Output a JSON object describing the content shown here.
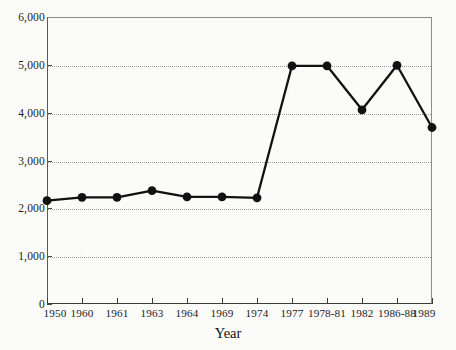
{
  "chart_data": {
    "type": "line",
    "title": "",
    "xlabel": "Year",
    "ylabel": "",
    "categories": [
      "1950",
      "1960",
      "1961",
      "1963",
      "1964",
      "1969",
      "1974",
      "1977",
      "1978-81",
      "1982",
      "1986-88",
      "1989"
    ],
    "values": [
      2160,
      2230,
      2230,
      2370,
      2240,
      2240,
      2220,
      4980,
      4980,
      4060,
      4990,
      3690
    ],
    "series": [
      {
        "name": "value",
        "values": [
          2160,
          2230,
          2230,
          2370,
          2240,
          2240,
          2220,
          4980,
          4980,
          4060,
          4990,
          3690
        ]
      }
    ],
    "ylim": [
      0,
      6000
    ],
    "ytick_values": [
      0,
      1000,
      2000,
      3000,
      4000,
      5000,
      6000
    ],
    "ytick_labels": [
      "0",
      "1,000",
      "2,000",
      "3,000",
      "4,000",
      "5,000",
      "6,000"
    ],
    "grid": true,
    "grid_axis": "y",
    "legend": "none",
    "marker": "filled-circle",
    "line_color": "#111111",
    "marker_color": "#111111",
    "grid_color": "#9a9a9c",
    "background_color": "#fbfbf9"
  }
}
